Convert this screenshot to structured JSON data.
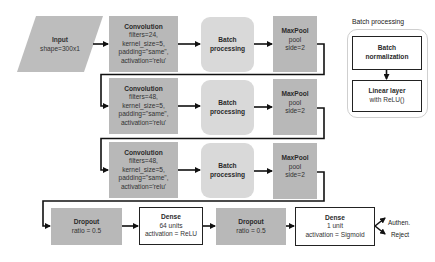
{
  "input": {
    "title": "Input",
    "detail": "shape=300x1"
  },
  "rows": [
    {
      "conv": {
        "title": "Convolution",
        "lines": [
          "filters=24,",
          "kernel_size=5,",
          "padding=\"same\",",
          "activation='relu'"
        ]
      },
      "batch": {
        "lines": [
          "Batch",
          "processing"
        ]
      },
      "pool": {
        "title": "MaxPool",
        "lines": [
          "pool",
          "side=2"
        ]
      }
    },
    {
      "conv": {
        "title": "Convolution",
        "lines": [
          "filters=48,",
          "kernel_size=5,",
          "padding=\"same\",",
          "activation='relu'"
        ]
      },
      "batch": {
        "lines": [
          "Batch",
          "processing"
        ]
      },
      "pool": {
        "title": "MaxPool",
        "lines": [
          "pool",
          "side=2"
        ]
      }
    },
    {
      "conv": {
        "title": "Convolution",
        "lines": [
          "filters=48,",
          "kernel_size=5,",
          "padding=\"same\",",
          "activation='relu'"
        ]
      },
      "batch": {
        "lines": [
          "Batch",
          "processing"
        ]
      },
      "pool": {
        "title": "MaxPool",
        "lines": [
          "pool",
          "side=2"
        ]
      }
    }
  ],
  "bottom": {
    "dropout1": {
      "title": "Dropout",
      "detail": "ratio = 0.5"
    },
    "dense1": {
      "title": "Dense",
      "lines": [
        "64 units",
        "activation = ReLU"
      ]
    },
    "dropout2": {
      "title": "Dropout",
      "detail": "ratio = 0.5"
    },
    "dense2": {
      "title": "Dense",
      "lines": [
        "1 unit",
        "activation = Sigmoid"
      ]
    }
  },
  "outputs": {
    "authen": "Authen.",
    "reject": "Reject"
  },
  "batch_panel": {
    "title": "Batch processing",
    "norm": [
      "Batch",
      "normalization"
    ],
    "linear": {
      "title": "Linear layer",
      "detail": "with ReLU()"
    }
  },
  "colors": {
    "dark_fill": "#b8b8b8",
    "light_fill": "#d9d9d9",
    "line": "#111111"
  }
}
